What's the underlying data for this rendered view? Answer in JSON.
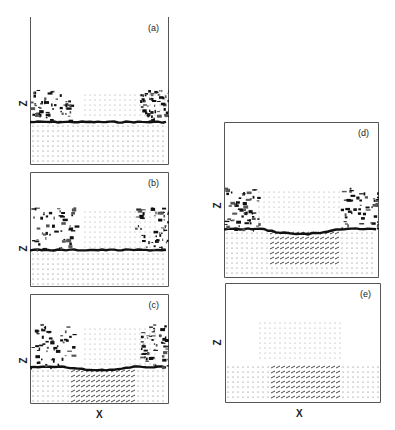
{
  "figure": {
    "axis_labels": {
      "x": "X",
      "z": "Z"
    },
    "panels": [
      {
        "id": "a",
        "label": "(a)",
        "box": [
          30,
          17,
          139,
          148
        ],
        "top_border": false,
        "interface_y": 105,
        "bulge": {
          "x0": 55,
          "x1": 140,
          "y0": 78
        },
        "blob_left": [
          0,
          40
        ],
        "blob_right": [
          110,
          139
        ],
        "depression": 0
      },
      {
        "id": "b",
        "label": "(b)",
        "box": [
          30,
          172,
          139,
          115
        ],
        "top_border": true,
        "interface_y": 78,
        "bulge": {
          "x0": 55,
          "x1": 130,
          "y0": 40
        },
        "blob_left": [
          0,
          45
        ],
        "blob_right": [
          105,
          139
        ],
        "depression": 0
      },
      {
        "id": "c",
        "label": "(c)",
        "box": [
          30,
          294,
          139,
          110
        ],
        "top_border": true,
        "interface_y": 73,
        "bulge": {
          "x0": 55,
          "x1": 130,
          "y0": 35
        },
        "blob_left": [
          0,
          45
        ],
        "blob_right": [
          110,
          139
        ],
        "depression": 6
      },
      {
        "id": "d",
        "label": "(d)",
        "box": [
          224,
          122,
          155,
          156
        ],
        "top_border": true,
        "interface_y": 107,
        "bulge": {
          "x0": 35,
          "x1": 120,
          "y0": 70
        },
        "blob_left": [
          0,
          35
        ],
        "blob_right": [
          115,
          155
        ],
        "depression": 10
      },
      {
        "id": "e",
        "label": "(e)",
        "box": [
          225,
          283,
          156,
          120
        ],
        "top_border": true,
        "interface_y": 80,
        "bulge": {
          "x0": 35,
          "x1": 120,
          "y0": 40
        },
        "blob_left": [
          0,
          0
        ],
        "blob_right": [
          156,
          156
        ],
        "depression": 12
      }
    ],
    "z_labels": [
      {
        "panel": "a",
        "x": 20,
        "y": 98
      },
      {
        "panel": "b",
        "x": 20,
        "y": 243
      },
      {
        "panel": "c",
        "x": 20,
        "y": 355
      },
      {
        "panel": "d",
        "x": 214,
        "y": 200
      },
      {
        "panel": "e",
        "x": 214,
        "y": 337
      }
    ],
    "x_labels": [
      {
        "column": "left",
        "x": 96,
        "y": 409
      },
      {
        "column": "right",
        "x": 296,
        "y": 408
      }
    ]
  }
}
